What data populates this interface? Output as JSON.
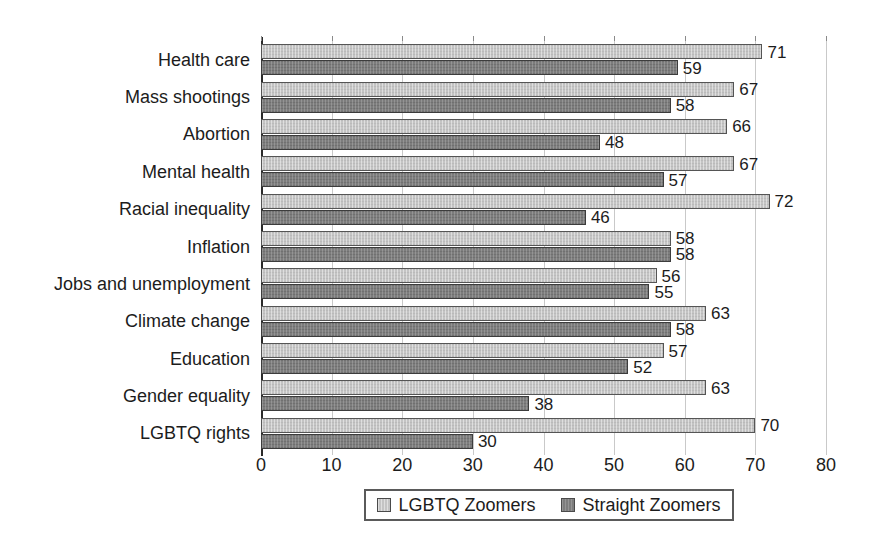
{
  "chart_data": {
    "type": "bar",
    "orientation": "horizontal",
    "title": "",
    "subtitle": "",
    "xlabel": "",
    "ylabel": "",
    "xlim": [
      0,
      80
    ],
    "xticks": [
      0,
      10,
      20,
      30,
      40,
      50,
      60,
      70,
      80
    ],
    "grid": true,
    "legend_position": "bottom",
    "categories": [
      "Health care",
      "Mass shootings",
      "Abortion",
      "Mental health",
      "Racial inequality",
      "Inflation",
      "Jobs and unemployment",
      "Climate change",
      "Education",
      "Gender equality",
      "LGBTQ rights"
    ],
    "series": [
      {
        "name": "LGBTQ Zoomers",
        "color": "#c4c4c4",
        "values": [
          71,
          67,
          66,
          67,
          72,
          58,
          56,
          63,
          57,
          63,
          70
        ]
      },
      {
        "name": "Straight Zoomers",
        "color": "#7d7d7d",
        "values": [
          59,
          58,
          48,
          57,
          46,
          58,
          55,
          58,
          52,
          38,
          30
        ]
      }
    ]
  },
  "legend": {
    "items": [
      {
        "label": "LGBTQ Zoomers",
        "swatch": "light"
      },
      {
        "label": "Straight Zoomers",
        "swatch": "dark"
      }
    ]
  },
  "colors": {
    "light_bar": "#c4c4c4",
    "dark_bar": "#7d7d7d",
    "axis": "#2a2a2a",
    "gridline": "#c9c9c9",
    "text": "#1c1c1c",
    "background": "#ffffff"
  }
}
